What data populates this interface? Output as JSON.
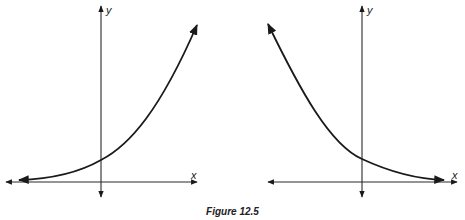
{
  "figure": {
    "caption": "Figure 12.5",
    "panels": [
      {
        "id": "left",
        "description": "Exponential growth curve",
        "x_axis_label": "x",
        "y_axis_label": "y"
      },
      {
        "id": "right",
        "description": "Exponential decay curve",
        "x_axis_label": "x",
        "y_axis_label": "y"
      }
    ]
  },
  "colors": {
    "ink": "#1a1a1a",
    "background": "#ffffff"
  }
}
